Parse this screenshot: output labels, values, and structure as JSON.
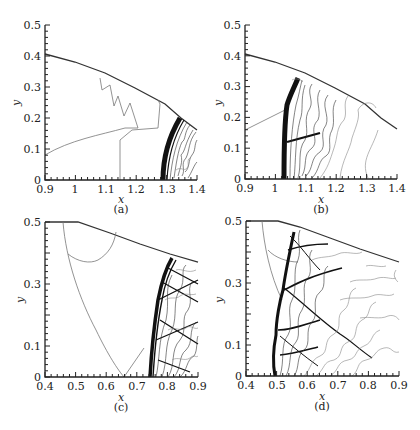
{
  "figure": {
    "panels": [
      {
        "id": "a",
        "caption": "(a)",
        "xlabel": "x",
        "ylabel": "y",
        "xticks": [
          "0.9",
          "1",
          "1.1",
          "1.2",
          "1.3",
          "1.4"
        ],
        "yticks": [
          "0",
          "0.1",
          "0.2",
          "0.3",
          "0.4",
          "0.5"
        ]
      },
      {
        "id": "b",
        "caption": "(b)",
        "xlabel": "x",
        "ylabel": "y",
        "xticks": [
          "0.9",
          "1",
          "1.1",
          "1.2",
          "1.3",
          "1.4"
        ],
        "yticks": [
          "0",
          "0.1",
          "0.2",
          "0.3",
          "0.4",
          "0.5"
        ]
      },
      {
        "id": "c",
        "caption": "(c)",
        "xlabel": "x",
        "ylabel": "y",
        "xticks": [
          "0.4",
          "0.5",
          "0.6",
          "0.7",
          "0.8",
          "0.9"
        ],
        "yticks": [
          "0",
          "0.1",
          "0.3",
          "0.5"
        ]
      },
      {
        "id": "d",
        "caption": "(d)",
        "xlabel": "x",
        "ylabel": "y",
        "xticks": [
          "0.4",
          "0.5",
          "0.6",
          "0.7",
          "0.8",
          "0.9"
        ],
        "yticks": [
          "0",
          "0.1",
          "0.3",
          "0.5"
        ]
      }
    ]
  },
  "chart_data": [
    {
      "type": "contour",
      "panel": "(a)",
      "title": "",
      "xlabel": "x",
      "ylabel": "y",
      "xlim": [
        0.9,
        1.4
      ],
      "ylim": [
        0,
        0.5
      ],
      "xticks": [
        0.9,
        1.0,
        1.1,
        1.2,
        1.3,
        1.4
      ],
      "yticks": [
        0,
        0.1,
        0.2,
        0.3,
        0.4,
        0.5
      ],
      "outer_boundary": {
        "x": [
          0.9,
          1.0,
          1.1,
          1.2,
          1.3,
          1.4
        ],
        "y": [
          0.385,
          0.36,
          0.325,
          0.28,
          0.225,
          0.165
        ]
      },
      "shock_front": {
        "x": [
          1.275,
          1.29,
          1.31,
          1.345
        ],
        "y": [
          0.0,
          0.07,
          0.14,
          0.2
        ]
      },
      "grid": false
    },
    {
      "type": "contour",
      "panel": "(b)",
      "title": "",
      "xlabel": "x",
      "ylabel": "y",
      "xlim": [
        0.9,
        1.4
      ],
      "ylim": [
        0,
        0.5
      ],
      "xticks": [
        0.9,
        1.0,
        1.1,
        1.2,
        1.3,
        1.4
      ],
      "yticks": [
        0,
        0.1,
        0.2,
        0.3,
        0.4,
        0.5
      ],
      "outer_boundary": {
        "x": [
          0.9,
          1.0,
          1.1,
          1.2,
          1.3,
          1.4
        ],
        "y": [
          0.385,
          0.36,
          0.325,
          0.28,
          0.225,
          0.165
        ]
      },
      "shock_front": {
        "x": [
          1.02,
          1.025,
          1.04,
          1.075
        ],
        "y": [
          0.0,
          0.1,
          0.2,
          0.325
        ]
      },
      "grid": false
    },
    {
      "type": "contour",
      "panel": "(c)",
      "title": "",
      "xlabel": "x",
      "ylabel": "y",
      "xlim": [
        0.4,
        0.9
      ],
      "ylim": [
        0,
        0.5
      ],
      "xticks": [
        0.4,
        0.5,
        0.6,
        0.7,
        0.8,
        0.9
      ],
      "yticks": [
        0,
        0.1,
        0.3,
        0.5
      ],
      "outer_boundary": {
        "x": [
          0.4,
          0.49,
          0.6,
          0.7,
          0.82,
          0.9
        ],
        "y": [
          0.5,
          0.5,
          0.47,
          0.44,
          0.41,
          0.39
        ]
      },
      "shock_front": {
        "x": [
          0.745,
          0.755,
          0.78,
          0.815
        ],
        "y": [
          0.0,
          0.15,
          0.3,
          0.41
        ]
      },
      "grid": false
    },
    {
      "type": "contour",
      "panel": "(d)",
      "title": "",
      "xlabel": "x",
      "ylabel": "y",
      "xlim": [
        0.4,
        0.9
      ],
      "ylim": [
        0,
        0.5
      ],
      "xticks": [
        0.4,
        0.5,
        0.6,
        0.7,
        0.8,
        0.9
      ],
      "yticks": [
        0,
        0.1,
        0.3,
        0.5
      ],
      "outer_boundary": {
        "x": [
          0.4,
          0.49,
          0.6,
          0.7,
          0.8,
          0.9
        ],
        "y": [
          0.5,
          0.5,
          0.47,
          0.44,
          0.41,
          0.39
        ]
      },
      "shock_front": {
        "x": [
          0.485,
          0.5,
          0.53,
          0.565
        ],
        "y": [
          0.0,
          0.15,
          0.3,
          0.49
        ]
      },
      "grid": false
    }
  ]
}
